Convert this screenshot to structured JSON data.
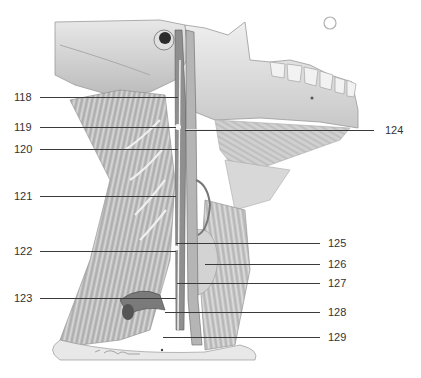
{
  "figure": {
    "colors": {
      "background": "#ffffff",
      "line": "#3a3a3a",
      "label": "#333333"
    },
    "labels_left": [
      {
        "id": "118",
        "text": "118",
        "y": 97,
        "line_x1": 40,
        "line_x2": 178
      },
      {
        "id": "119",
        "text": "119",
        "y": 127,
        "line_x1": 40,
        "line_x2": 176
      },
      {
        "id": "120",
        "text": "120",
        "y": 149,
        "line_x1": 40,
        "line_x2": 178
      },
      {
        "id": "121",
        "text": "121",
        "y": 196,
        "line_x1": 40,
        "line_x2": 176
      },
      {
        "id": "122",
        "text": "122",
        "y": 251,
        "line_x1": 40,
        "line_x2": 176
      },
      {
        "id": "123",
        "text": "123",
        "y": 298,
        "line_x1": 40,
        "line_x2": 176
      }
    ],
    "labels_right": [
      {
        "id": "124",
        "text": "124",
        "y": 130,
        "line_x1": 185,
        "line_x2": 374
      },
      {
        "id": "125",
        "text": "125",
        "y": 243,
        "line_x1": 176,
        "line_x2": 320
      },
      {
        "id": "126",
        "text": "126",
        "y": 264,
        "line_x1": 205,
        "line_x2": 320
      },
      {
        "id": "127",
        "text": "127",
        "y": 283,
        "line_x1": 177,
        "line_x2": 320
      },
      {
        "id": "128",
        "text": "128",
        "y": 312,
        "line_x1": 165,
        "line_x2": 320
      },
      {
        "id": "129",
        "text": "129",
        "y": 337,
        "line_x1": 163,
        "line_x2": 320
      }
    ]
  }
}
